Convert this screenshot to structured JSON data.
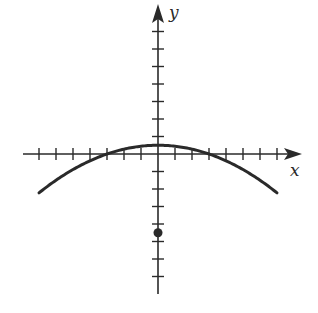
{
  "chart_data": {
    "type": "line",
    "title": "",
    "xlabel": "x",
    "ylabel": "y",
    "xlim": [
      -8,
      8.5
    ],
    "ylim": [
      -8,
      8.5
    ],
    "grid": false,
    "legend": null,
    "x_ticks": [
      -7,
      -6,
      -5,
      -4,
      -3,
      -2,
      -1,
      1,
      2,
      3,
      4,
      5,
      6,
      7
    ],
    "y_ticks": [
      -7,
      -6,
      -5,
      -4,
      -3,
      -2,
      -1,
      1,
      2,
      3,
      4,
      5,
      6,
      7
    ],
    "tick_labels_shown": false,
    "series": [
      {
        "name": "parabola",
        "kind": "curve",
        "equation": "y = 0.5 - x^2/18",
        "vertex": [
          0,
          0.5
        ],
        "x_intercepts": [
          -3,
          3
        ],
        "domain": [
          -7,
          7
        ],
        "x": [
          -7,
          -6,
          -5,
          -4,
          -3,
          -2,
          -1,
          0,
          1,
          2,
          3,
          4,
          5,
          6,
          7
        ],
        "y": [
          -2.22,
          -1.5,
          -0.89,
          -0.39,
          0,
          0.28,
          0.44,
          0.5,
          0.44,
          0.28,
          0,
          -0.39,
          -0.89,
          -1.5,
          -2.22
        ],
        "color": "#2a2a2a"
      },
      {
        "name": "point",
        "kind": "scatter",
        "x": [
          0
        ],
        "y": [
          -4.5
        ],
        "color": "#2a2a2a"
      }
    ]
  },
  "axes": {
    "x_label": "x",
    "y_label": "y",
    "color": "#2a2a2a"
  }
}
